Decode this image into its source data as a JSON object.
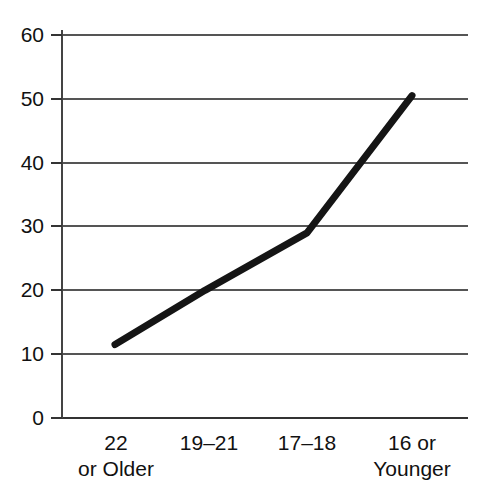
{
  "chart_data": {
    "type": "line",
    "title": "",
    "subtitle": "",
    "xlabel": "",
    "ylabel": "",
    "categories": [
      "22 or Older",
      "19–21",
      "17–18",
      "16 or Younger"
    ],
    "category_lines": [
      [
        "22",
        "or Older"
      ],
      [
        "19–21",
        ""
      ],
      [
        "17–18",
        ""
      ],
      [
        "16 or",
        "Younger"
      ]
    ],
    "values": [
      11.5,
      20,
      29,
      50.5
    ],
    "series": [
      {
        "name": "",
        "values": [
          11.5,
          20,
          29,
          50.5
        ]
      }
    ],
    "ylim": [
      0,
      60
    ],
    "yticks": [
      0,
      10,
      20,
      30,
      40,
      50,
      60
    ],
    "ytick_labels": [
      "0",
      "10",
      "20",
      "30",
      "40",
      "50",
      "60"
    ],
    "grid": true,
    "grid_axis": "y",
    "legend": false,
    "legend_position": "none",
    "annotations": [],
    "colors": {
      "line": "#151515",
      "grid": "#555555",
      "axis": "#333333",
      "text": "#111111",
      "background": "#ffffff"
    },
    "line_width_px": 7
  }
}
